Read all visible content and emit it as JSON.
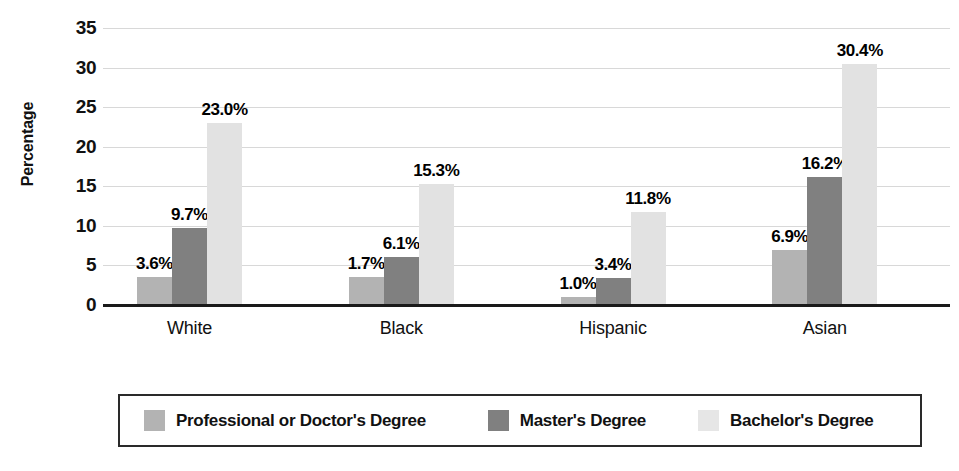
{
  "chart_data": {
    "type": "bar",
    "title": "",
    "subtitle": "",
    "xlabel": "",
    "ylabel": "Percentage",
    "ylim": [
      0,
      35
    ],
    "yticks": [
      0,
      5,
      10,
      15,
      20,
      25,
      30,
      35
    ],
    "ytick_labels": [
      "0",
      "5",
      "10",
      "15",
      "20",
      "25",
      "30",
      "35"
    ],
    "grid": true,
    "legend_position": "bottom",
    "categories": [
      "White",
      "Black",
      "Hispanic",
      "Asian"
    ],
    "series": [
      {
        "name": "Professional or Doctor's Degree",
        "color": "#b3b3b3",
        "values": [
          3.6,
          1.7,
          1.0,
          6.9
        ],
        "bar_heights": [
          3.6,
          3.6,
          1.0,
          6.9
        ],
        "labels": [
          "3.6%",
          "1.7%",
          "1.0%",
          "6.9%"
        ]
      },
      {
        "name": "Master's Degree",
        "color": "#808080",
        "values": [
          9.7,
          6.1,
          3.4,
          16.2
        ],
        "bar_heights": [
          9.7,
          6.1,
          3.4,
          16.2
        ],
        "labels": [
          "9.7%",
          "6.1%",
          "3.4%",
          "16.2%"
        ]
      },
      {
        "name": "Bachelor's Degree",
        "color": "#e2e2e2",
        "values": [
          23.0,
          15.3,
          11.8,
          30.4
        ],
        "bar_heights": [
          23.0,
          15.3,
          11.8,
          30.4
        ],
        "labels": [
          "23.0%",
          "15.3%",
          "11.8%",
          "30.4%"
        ]
      }
    ]
  },
  "legend": {
    "items": [
      {
        "label": "Professional or Doctor's Degree",
        "color": "#b3b3b3"
      },
      {
        "label": "Master's Degree",
        "color": "#808080"
      },
      {
        "label": "Bachelor's Degree",
        "color": "#e6e6e6"
      }
    ]
  }
}
